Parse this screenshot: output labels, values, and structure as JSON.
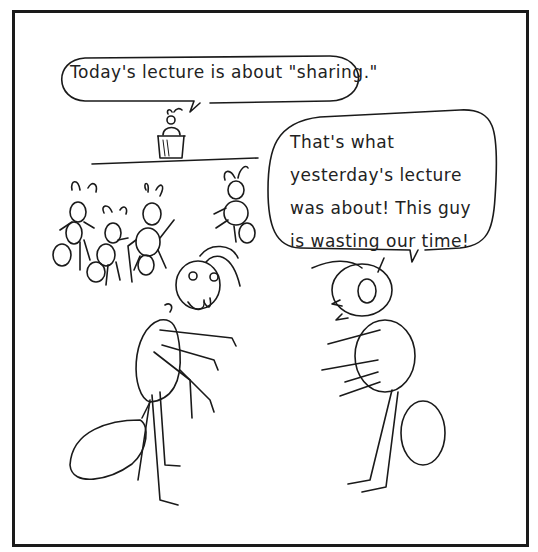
{
  "comic": {
    "panel_count": 1,
    "speech_bubbles": [
      {
        "speaker": "lecturer-ant",
        "text": "Today's lecture is about \"sharing.\""
      },
      {
        "speaker": "right-ant",
        "lines": [
          "That's what",
          "yesterday's lecture",
          "was about! This guy",
          "is wasting our time!"
        ]
      }
    ],
    "characters": [
      "lecturer-ant",
      "audience-ant",
      "audience-ant",
      "audience-ant",
      "audience-ant",
      "left-ant",
      "right-ant"
    ],
    "colors": {
      "ink": "#1a1a1a",
      "paper": "#ffffff"
    }
  }
}
